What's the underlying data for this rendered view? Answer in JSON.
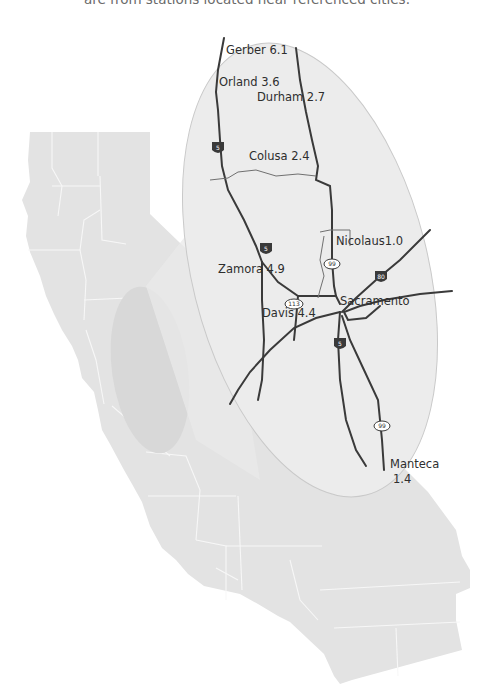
{
  "caption": "are from stations located near referenced cities.",
  "map": {
    "title": "Northern Sacramento Valley station map",
    "colors": {
      "state_fill": "#e3e3e3",
      "county_lines": "#f6f6f6",
      "zoom_oval": "#ececec",
      "highlight_region": "#d9d9d9",
      "roads": "#3a3a3a",
      "labels": "#2e2e2e"
    },
    "stations": [
      {
        "name": "Gerber",
        "value": "6.1",
        "label": "Gerber 6.1"
      },
      {
        "name": "Orland",
        "value": "3.6",
        "label": "Orland 3.6"
      },
      {
        "name": "Durham",
        "value": "2.7",
        "label": "Durham 2.7"
      },
      {
        "name": "Colusa",
        "value": "2.4",
        "label": "Colusa 2.4"
      },
      {
        "name": "Nicolaus",
        "value": "1.0",
        "label": "Nicolaus1.0"
      },
      {
        "name": "Zamora",
        "value": "4.9",
        "label": "Zamora 4.9"
      },
      {
        "name": "Davis",
        "value": "4.4",
        "label": "Davis 4.4"
      },
      {
        "name": "Sacramento",
        "value": "",
        "label": "Sacramento"
      },
      {
        "name": "Manteca",
        "value": "1.4",
        "label_line1": "Manteca",
        "label_line2": "1.4"
      }
    ],
    "shields": {
      "i5": "5",
      "i80": "80",
      "sr99": "99",
      "sr113": "113"
    }
  }
}
